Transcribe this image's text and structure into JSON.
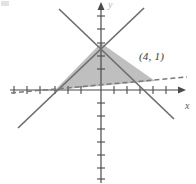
{
  "figure": {
    "width": 196,
    "height": 184,
    "background": "#ffffff",
    "kind": "coordinate-plane-with-shaded-triangle"
  },
  "axes": {
    "origin": {
      "x": 101,
      "y": 90
    },
    "tick_spacing_px": 13,
    "x_axis": {
      "label": "x",
      "label_pos": {
        "x": 185,
        "y": 101
      },
      "start_px": 10,
      "end_px": 181,
      "arrow": "right",
      "tick_count_left": 7,
      "tick_count_right": 6,
      "tick_half_length": 4,
      "color": "#4a4a4a"
    },
    "y_axis": {
      "label": "y",
      "label_pos": {
        "x": 108,
        "y": 0
      },
      "start_px": 3,
      "end_px": 183,
      "arrow": "up",
      "tick_count_up": 6,
      "tick_count_down": 7,
      "tick_half_length": 4,
      "color": "#4a4a4a"
    }
  },
  "lines": [
    {
      "name": "ascending-solid-line",
      "style": "solid",
      "color": "#6e6e6e",
      "width": 1.6,
      "from": {
        "x": 18,
        "y": 128
      },
      "to": {
        "x": 144,
        "y": 8
      }
    },
    {
      "name": "descending-solid-line",
      "style": "solid",
      "color": "#6e6e6e",
      "width": 1.6,
      "from": {
        "x": 59,
        "y": 9
      },
      "to": {
        "x": 174,
        "y": 119
      }
    },
    {
      "name": "dashed-line",
      "style": "dashed",
      "color": "#7a7a7a",
      "width": 1.4,
      "dash": "5 3",
      "from": {
        "x": 11,
        "y": 93
      },
      "to": {
        "x": 187,
        "y": 77
      }
    }
  ],
  "shaded_region": {
    "name": "shaded-triangle",
    "fill": "#b4b4b4",
    "fill_opacity": 0.85,
    "stroke": "none",
    "vertices": [
      {
        "x": 101,
        "y": 43
      },
      {
        "x": 55,
        "y": 90
      },
      {
        "x": 155,
        "y": 81
      }
    ]
  },
  "annotations": [
    {
      "name": "point-label-4-1",
      "text": "(4, 1)",
      "pos": {
        "x": 140,
        "y": 52
      },
      "target": {
        "x": 155,
        "y": 81
      }
    }
  ],
  "colors": {
    "axis": "#4a4a4a",
    "line": "#6e6e6e",
    "dashed_line": "#7a7a7a",
    "fill": "#b4b4b4",
    "label_text": "#3a3a3a",
    "background": "#ffffff"
  }
}
